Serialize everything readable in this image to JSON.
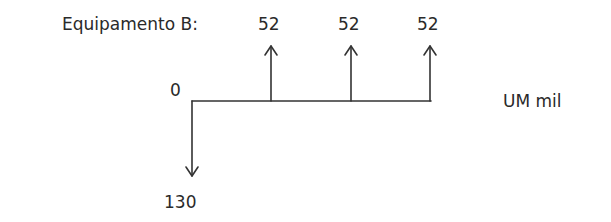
{
  "title": "Equipamento B:",
  "unit": "UM mil",
  "origin_label": "0",
  "outflow": {
    "value": "130",
    "period": 0
  },
  "inflows": [
    {
      "value": "52",
      "period": 1
    },
    {
      "value": "52",
      "period": 2
    },
    {
      "value": "52",
      "period": 3
    }
  ],
  "colors": {
    "line": "#333333",
    "text": "#2a2a2a"
  }
}
